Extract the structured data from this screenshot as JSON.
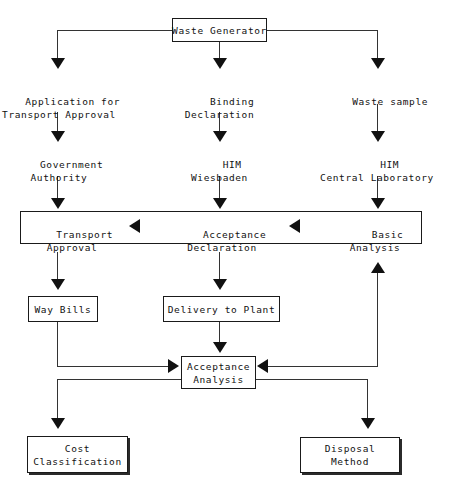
{
  "diagram": {
    "type": "flowchart",
    "colors": {
      "background": "#ffffff",
      "line": "#333333",
      "arrowhead": "#111111",
      "box_border": "#1a1a1a",
      "text": "#111111",
      "shadow": "#2b2b2b"
    },
    "nodes": {
      "waste_generator": "Waste Generator",
      "application_transport_approval": "Application for\nTransport Approval",
      "binding_declaration": "Binding\nDeclaration",
      "waste_sample": "Waste sample",
      "government_authority": "Government\nAuthority",
      "him_wiesbaden": "HIM\nWiesbaden",
      "him_central_laboratory": "HIM\nCentral Laboratory",
      "transport_approval": "Transport\nApproval",
      "acceptance_declaration": "Acceptance\nDeclaration",
      "basic_analysis": "Basic\nAnalysis",
      "way_bills": "Way Bills",
      "delivery_to_plant": "Delivery to Plant",
      "acceptance_analysis": "Acceptance\nAnalysis",
      "cost_classification": "Cost\nClassification",
      "disposal_method": "Disposal\nMethod"
    },
    "edges": [
      {
        "from": "waste_generator",
        "to": "application_transport_approval",
        "style": "elbow-left-down"
      },
      {
        "from": "waste_generator",
        "to": "binding_declaration",
        "style": "straight-down"
      },
      {
        "from": "waste_generator",
        "to": "waste_sample",
        "style": "elbow-right-down"
      },
      {
        "from": "application_transport_approval",
        "to": "government_authority",
        "style": "straight-down"
      },
      {
        "from": "binding_declaration",
        "to": "him_wiesbaden",
        "style": "straight-down"
      },
      {
        "from": "waste_sample",
        "to": "him_central_laboratory",
        "style": "straight-down"
      },
      {
        "from": "government_authority",
        "to": "transport_approval",
        "style": "straight-down"
      },
      {
        "from": "him_wiesbaden",
        "to": "acceptance_declaration",
        "style": "straight-down"
      },
      {
        "from": "him_central_laboratory",
        "to": "basic_analysis",
        "style": "straight-down"
      },
      {
        "from": "basic_analysis",
        "to": "acceptance_declaration",
        "style": "arrow-left"
      },
      {
        "from": "acceptance_declaration",
        "to": "transport_approval",
        "style": "arrow-left"
      },
      {
        "from": "transport_approval",
        "to": "way_bills",
        "style": "straight-down"
      },
      {
        "from": "acceptance_declaration",
        "to": "delivery_to_plant",
        "style": "straight-down"
      },
      {
        "from": "way_bills",
        "to": "acceptance_analysis",
        "style": "elbow-right"
      },
      {
        "from": "delivery_to_plant",
        "to": "acceptance_analysis",
        "style": "straight-down"
      },
      {
        "from": "acceptance_analysis",
        "to": "basic_analysis",
        "style": "feedback-up-right"
      },
      {
        "from": "acceptance_analysis",
        "to": "cost_classification",
        "style": "elbow-left-down"
      },
      {
        "from": "acceptance_analysis",
        "to": "disposal_method",
        "style": "elbow-right-down"
      }
    ]
  }
}
